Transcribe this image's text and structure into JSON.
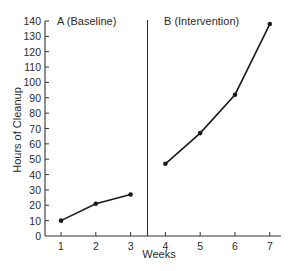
{
  "chart_data": {
    "type": "line",
    "title": "",
    "xlabel": "Weeks",
    "ylabel": "Hours of Cleanup",
    "x": [
      1,
      2,
      3,
      4,
      5,
      6,
      7
    ],
    "xticks": [
      "1",
      "2",
      "3",
      "4",
      "5",
      "6",
      "7"
    ],
    "yticks": [
      "0",
      "10",
      "20",
      "30",
      "40",
      "50",
      "60",
      "70",
      "80",
      "90",
      "100",
      "110",
      "120",
      "130",
      "140"
    ],
    "ylim": [
      0,
      140
    ],
    "xlim": [
      0.5,
      7.3
    ],
    "grid": false,
    "legend": "none",
    "phase_change_after_week": 3.5,
    "phases": [
      {
        "label": "A (Baseline)",
        "weeks": [
          1,
          2,
          3
        ],
        "values": [
          10,
          21,
          27
        ]
      },
      {
        "label": "B (Intervention)",
        "weeks": [
          4,
          5,
          6,
          7
        ],
        "values": [
          47,
          67,
          92,
          138
        ]
      }
    ],
    "series": [
      {
        "name": "Hours of Cleanup",
        "values": [
          10,
          21,
          27,
          47,
          67,
          92,
          138
        ]
      }
    ],
    "colors": {
      "line": "#1a1a1a",
      "axis": "#333333",
      "text": "#2a2a2a"
    }
  }
}
